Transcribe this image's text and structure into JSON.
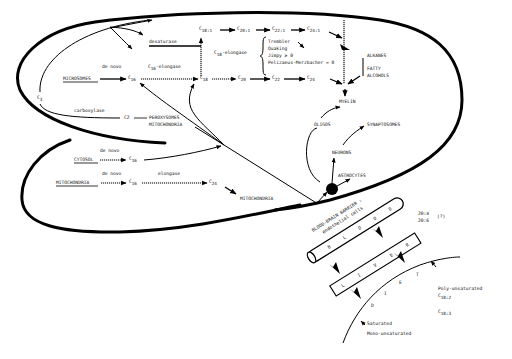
{
  "diagram": {
    "compartments": {
      "microsomes": "MICROSOMES",
      "cytosol": "CYTOSOL",
      "mitochondria_source": "MITOCHONDRIA"
    },
    "precursors": {
      "c3": "C",
      "c3_sub": "3",
      "c2": "C2",
      "carboxylase": "carboxylase",
      "perox_1": "PEROXYSOMES",
      "perox_2": "MITOCHONDRIA"
    },
    "enzymes": {
      "de_novo": "de novo",
      "c16_elongase_c": "C",
      "c16_elongase_sub": "16",
      "c16_elongase_rest": "-elongase",
      "c18_elongase_c": "C",
      "c18_elongase_sub": "18",
      "c18_elongase_rest": "-elongase",
      "desaturase": "desaturase",
      "elongase": "elongase"
    },
    "fatty_acids": {
      "c": "C",
      "c16": "16",
      "c18": "18",
      "c20": "20",
      "c22": "22",
      "c24": "24",
      "c18_1": "18:1",
      "c20_1": "20:1",
      "c22_1": "22:1",
      "c24_1": "24:1"
    },
    "mutants": [
      "Trembler",
      "Quaking",
      "Jimpy ≥ 0",
      "Pelizaeus-Merzbacher = 0"
    ],
    "products": {
      "alkanes": "ALKANES",
      "fatty": "FATTY",
      "alcohols": "ALCOHOLS",
      "myelin": "MYELIN",
      "oligos": "OLIGOS",
      "synaptosomes": "SYNAPTOSOMES",
      "neurons": "NEURONS",
      "astrocytes": "ASTROCYTES",
      "mitochondria_target": "MITOCHONDRIA"
    },
    "barrier": {
      "title": "BLOOD-BRAIN BARRIER :",
      "subtitle": "endothelial cells",
      "blood": [
        "B",
        "L",
        "O",
        "O",
        "D"
      ],
      "liver": [
        "L",
        "I",
        "V",
        "E",
        "R"
      ],
      "diet": [
        "D",
        "I",
        "E",
        "T"
      ],
      "pufa_1": "20:4",
      "pufa_2": "20:6",
      "pufa_q": "(?)"
    },
    "diet_inputs": {
      "poly": "Poly-unsaturated",
      "c": "C",
      "c18_2": "18:2",
      "c18_3": "18:3",
      "saturated": "Saturated",
      "mono": "Mono-unsaturated"
    }
  }
}
